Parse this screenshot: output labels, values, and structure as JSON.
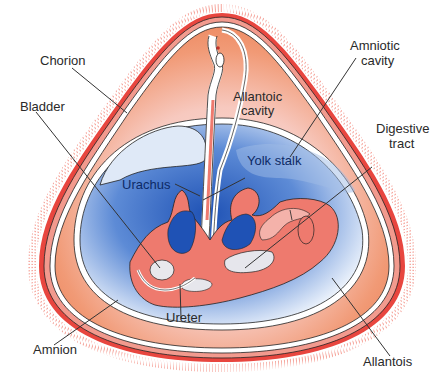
{
  "figure": {
    "cropped_title_fragment": "",
    "colors": {
      "chorion_red": "#e8463f",
      "villi_pink": "#f4a49a",
      "allantoic_orange": "#ef8a63",
      "amniotic_blue": "#2f64c0",
      "embryo_salmon": "#ee7a6e",
      "membrane_white": "#ffffff",
      "outline": "#333333"
    },
    "labels": {
      "chorion": "Chorion",
      "amniotic_cavity_line1": "Amniotic",
      "amniotic_cavity_line2": "cavity",
      "allantoic_cavity_line1": "Allantoic",
      "allantoic_cavity_line2": "cavity",
      "digestive_tract_line1": "Digestive",
      "digestive_tract_line2": "tract",
      "bladder": "Bladder",
      "yolk_stalk": "Yolk stalk",
      "urachus": "Urachus",
      "ureter": "Ureter",
      "amnion": "Amnion",
      "allantois": "Allantois"
    }
  }
}
